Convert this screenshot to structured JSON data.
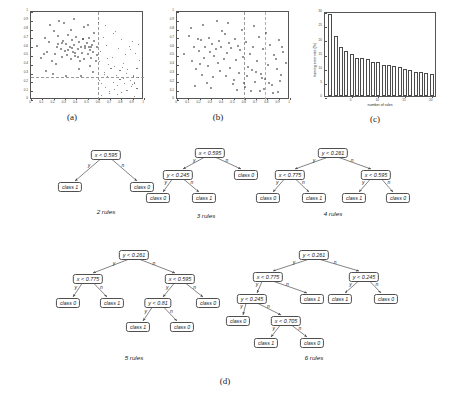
{
  "figure": {
    "subcaptions": [
      "(a)",
      "(b)",
      "(c)",
      "(d)"
    ]
  },
  "chart_data": [
    {
      "panel": "(a)",
      "type": "scatter",
      "title": "",
      "xlabel": "",
      "ylabel": "",
      "xlim": [
        0,
        1
      ],
      "ylim": [
        0,
        1
      ],
      "xticks": [
        0,
        0.1,
        0.2,
        0.3,
        0.4,
        0.5,
        0.6,
        0.7,
        0.8,
        0.9,
        1
      ],
      "yticks": [
        0,
        0.1,
        0.2,
        0.3,
        0.4,
        0.5,
        0.6,
        0.7,
        0.8,
        0.9,
        1
      ],
      "grid": false,
      "legend": "none",
      "annotations": [
        "vertical dashed split at x = 0.595",
        "horizontal dashed split at y = 0.261"
      ],
      "split_lines": {
        "vertical_x": 0.595,
        "horizontal_y": 0.261
      },
      "series": [
        {
          "name": "class 1",
          "marker": "circle",
          "x": [
            0.05,
            0.09,
            0.12,
            0.14,
            0.16,
            0.18,
            0.2,
            0.21,
            0.23,
            0.24,
            0.26,
            0.27,
            0.28,
            0.3,
            0.31,
            0.32,
            0.33,
            0.34,
            0.35,
            0.36,
            0.37,
            0.38,
            0.39,
            0.4,
            0.41,
            0.42,
            0.43,
            0.44,
            0.45,
            0.46,
            0.47,
            0.48,
            0.49,
            0.5,
            0.51,
            0.52,
            0.53,
            0.54,
            0.55,
            0.56,
            0.57,
            0.58,
            0.13,
            0.17,
            0.22,
            0.29,
            0.35,
            0.42,
            0.47,
            0.52,
            0.56,
            0.19,
            0.25,
            0.31,
            0.38,
            0.44,
            0.5,
            0.55,
            0.11,
            0.24,
            0.36,
            0.48,
            0.58,
            0.33,
            0.41,
            0.46,
            0.53,
            0.27,
            0.39,
            0.51
          ],
          "y": [
            0.62,
            0.48,
            0.71,
            0.55,
            0.66,
            0.44,
            0.79,
            0.52,
            0.61,
            0.73,
            0.58,
            0.49,
            0.67,
            0.56,
            0.64,
            0.51,
            0.74,
            0.6,
            0.47,
            0.68,
            0.55,
            0.63,
            0.5,
            0.72,
            0.58,
            0.66,
            0.45,
            0.61,
            0.54,
            0.69,
            0.47,
            0.59,
            0.65,
            0.52,
            0.71,
            0.57,
            0.48,
            0.63,
            0.55,
            0.67,
            0.44,
            0.6,
            0.33,
            0.85,
            0.41,
            0.88,
            0.8,
            0.36,
            0.83,
            0.39,
            0.76,
            0.3,
            0.9,
            0.28,
            0.92,
            0.27,
            0.86,
            0.32,
            0.53,
            0.64,
            0.59,
            0.62,
            0.51,
            0.57,
            0.49,
            0.7,
            0.61,
            0.65,
            0.54,
            0.6
          ]
        },
        {
          "name": "class 0",
          "marker": "circle",
          "x": [
            0.61,
            0.63,
            0.65,
            0.66,
            0.68,
            0.7,
            0.71,
            0.73,
            0.74,
            0.76,
            0.77,
            0.79,
            0.8,
            0.82,
            0.83,
            0.85,
            0.86,
            0.88,
            0.89,
            0.91,
            0.92,
            0.94,
            0.95,
            0.62,
            0.67,
            0.72,
            0.78,
            0.84,
            0.9,
            0.96,
            0.64,
            0.69,
            0.75,
            0.81,
            0.87,
            0.93,
            0.6,
            0.66,
            0.73,
            0.8,
            0.88,
            0.95,
            0.63,
            0.7,
            0.77,
            0.85,
            0.92,
            0.61,
            0.74,
            0.86,
            0.65,
            0.79,
            0.9,
            0.68,
            0.82,
            0.94
          ],
          "y": [
            0.22,
            0.18,
            0.31,
            0.14,
            0.26,
            0.09,
            0.35,
            0.2,
            0.12,
            0.28,
            0.16,
            0.33,
            0.08,
            0.24,
            0.18,
            0.3,
            0.11,
            0.22,
            0.15,
            0.27,
            0.19,
            0.13,
            0.25,
            0.55,
            0.62,
            0.48,
            0.58,
            0.51,
            0.66,
            0.45,
            0.71,
            0.4,
            0.78,
            0.37,
            0.6,
            0.53,
            0.88,
            0.84,
            0.75,
            0.68,
            0.57,
            0.63,
            0.05,
            0.07,
            0.06,
            0.1,
            0.04,
            0.43,
            0.38,
            0.34,
            0.29,
            0.23,
            0.17,
            0.47,
            0.41,
            0.36
          ]
        }
      ]
    },
    {
      "panel": "(b)",
      "type": "scatter",
      "title": "",
      "xlabel": "",
      "ylabel": "",
      "xlim": [
        0,
        1
      ],
      "ylim": [
        0,
        1
      ],
      "xticks": [
        0,
        0.1,
        0.2,
        0.3,
        0.4,
        0.5,
        0.6,
        0.7,
        0.8,
        0.9,
        1
      ],
      "yticks": [
        0,
        0.1,
        0.2,
        0.3,
        0.4,
        0.5,
        0.6,
        0.7,
        0.8,
        0.9,
        1
      ],
      "grid": false,
      "legend": "none",
      "annotations": [
        "vertical dashed split near x = 0.595",
        "vertical dashed split near x = 0.775"
      ],
      "split_lines": {
        "vertical_x": 0.595,
        "vertical_x2": 0.775
      },
      "series": [
        {
          "name": "points",
          "marker": "circle",
          "x": [
            0.06,
            0.1,
            0.13,
            0.15,
            0.17,
            0.19,
            0.21,
            0.22,
            0.24,
            0.25,
            0.27,
            0.28,
            0.29,
            0.31,
            0.32,
            0.33,
            0.34,
            0.36,
            0.37,
            0.38,
            0.39,
            0.41,
            0.42,
            0.43,
            0.44,
            0.46,
            0.47,
            0.48,
            0.5,
            0.51,
            0.52,
            0.54,
            0.55,
            0.56,
            0.58,
            0.59,
            0.61,
            0.62,
            0.64,
            0.66,
            0.67,
            0.69,
            0.71,
            0.72,
            0.74,
            0.76,
            0.78,
            0.8,
            0.82,
            0.84,
            0.86,
            0.88,
            0.9,
            0.92,
            0.94,
            0.96,
            0.12,
            0.23,
            0.35,
            0.45,
            0.57,
            0.68,
            0.79,
            0.91,
            0.16,
            0.3,
            0.4,
            0.53,
            0.65,
            0.77,
            0.89,
            0.2,
            0.26,
            0.49,
            0.6,
            0.73,
            0.85,
            0.18,
            0.63,
            0.7,
            0.75,
            0.81,
            0.87,
            0.93
          ],
          "y": [
            0.52,
            0.73,
            0.44,
            0.61,
            0.35,
            0.56,
            0.68,
            0.29,
            0.48,
            0.6,
            0.39,
            0.71,
            0.55,
            0.64,
            0.26,
            0.5,
            0.58,
            0.42,
            0.67,
            0.33,
            0.61,
            0.47,
            0.75,
            0.28,
            0.54,
            0.65,
            0.37,
            0.59,
            0.23,
            0.7,
            0.46,
            0.62,
            0.31,
            0.57,
            0.49,
            0.19,
            0.66,
            0.27,
            0.53,
            0.34,
            0.6,
            0.21,
            0.45,
            0.72,
            0.3,
            0.58,
            0.24,
            0.4,
            0.63,
            0.17,
            0.51,
            0.36,
            0.68,
            0.29,
            0.55,
            0.42,
            0.82,
            0.86,
            0.9,
            0.88,
            0.8,
            0.84,
            0.76,
            0.22,
            0.16,
            0.14,
            0.79,
            0.12,
            0.1,
            0.13,
            0.09,
            0.41,
            0.2,
            0.18,
            0.15,
            0.11,
            0.08,
            0.69,
            0.38,
            0.32,
            0.25,
            0.19,
            0.47,
            0.61
          ]
        }
      ]
    },
    {
      "panel": "(c)",
      "type": "bar",
      "title": "",
      "xlabel": "number of rules",
      "ylabel": "training error rate (%)",
      "xlim": [
        0,
        21
      ],
      "ylim": [
        0,
        30
      ],
      "xticks": [
        5,
        10,
        15,
        20
      ],
      "yticks": [
        0,
        5,
        10,
        15,
        20,
        25,
        30
      ],
      "grid": false,
      "legend": "none",
      "categories": [
        1,
        2,
        3,
        4,
        5,
        6,
        7,
        8,
        9,
        10,
        11,
        12,
        13,
        14,
        15,
        16,
        17,
        18,
        19,
        20
      ],
      "values": [
        28.8,
        21.2,
        17.3,
        16.0,
        15.0,
        13.4,
        13.3,
        13.2,
        12.0,
        12.0,
        11.0,
        10.8,
        10.6,
        10.4,
        9.4,
        9.2,
        8.5,
        8.5,
        8.0,
        7.8
      ]
    }
  ],
  "trees": [
    {
      "caption": "2 rules",
      "nodes": [
        {
          "id": "r",
          "label": "x < 0.595",
          "kind": "test"
        },
        {
          "id": "l1",
          "label": "class 1",
          "kind": "leaf"
        },
        {
          "id": "l2",
          "label": "class 0",
          "kind": "leaf"
        }
      ],
      "edges": [
        {
          "from": "r",
          "to": "l1",
          "label": "y"
        },
        {
          "from": "r",
          "to": "l2",
          "label": "n"
        }
      ]
    },
    {
      "caption": "3 rules",
      "nodes": [
        {
          "id": "r",
          "label": "x < 0.595",
          "kind": "test"
        },
        {
          "id": "a",
          "label": "y < 0.245",
          "kind": "test"
        },
        {
          "id": "l1",
          "label": "class 0",
          "kind": "leaf"
        },
        {
          "id": "l2",
          "label": "class 1",
          "kind": "leaf"
        },
        {
          "id": "l3",
          "label": "class 0",
          "kind": "leaf"
        }
      ],
      "edges": [
        {
          "from": "r",
          "to": "a",
          "label": "y"
        },
        {
          "from": "r",
          "to": "l3",
          "label": "n"
        },
        {
          "from": "a",
          "to": "l1",
          "label": "y"
        },
        {
          "from": "a",
          "to": "l2",
          "label": "n"
        }
      ]
    },
    {
      "caption": "4 rules",
      "nodes": [
        {
          "id": "r",
          "label": "y < 0.261",
          "kind": "test"
        },
        {
          "id": "a",
          "label": "x < 0.775",
          "kind": "test"
        },
        {
          "id": "b",
          "label": "x < 0.595",
          "kind": "test"
        },
        {
          "id": "l1",
          "label": "class 0",
          "kind": "leaf"
        },
        {
          "id": "l2",
          "label": "class 1",
          "kind": "leaf"
        },
        {
          "id": "l3",
          "label": "class 1",
          "kind": "leaf"
        },
        {
          "id": "l4",
          "label": "class 0",
          "kind": "leaf"
        }
      ],
      "edges": [
        {
          "from": "r",
          "to": "a",
          "label": "y"
        },
        {
          "from": "r",
          "to": "b",
          "label": "n"
        },
        {
          "from": "a",
          "to": "l1",
          "label": "y"
        },
        {
          "from": "a",
          "to": "l2",
          "label": "n"
        },
        {
          "from": "b",
          "to": "l3",
          "label": "y"
        },
        {
          "from": "b",
          "to": "l4",
          "label": "n"
        }
      ]
    },
    {
      "caption": "5 rules",
      "nodes": [
        {
          "id": "r",
          "label": "y < 0.261",
          "kind": "test"
        },
        {
          "id": "a",
          "label": "x < 0.775",
          "kind": "test"
        },
        {
          "id": "b",
          "label": "x < 0.595",
          "kind": "test"
        },
        {
          "id": "c",
          "label": "y < 0.81",
          "kind": "test"
        },
        {
          "id": "l1",
          "label": "class 0",
          "kind": "leaf"
        },
        {
          "id": "l2",
          "label": "class 1",
          "kind": "leaf"
        },
        {
          "id": "l3",
          "label": "class 1",
          "kind": "leaf"
        },
        {
          "id": "l4",
          "label": "class 0",
          "kind": "leaf"
        },
        {
          "id": "l5",
          "label": "class 0",
          "kind": "leaf"
        }
      ],
      "edges": [
        {
          "from": "r",
          "to": "a",
          "label": "y"
        },
        {
          "from": "r",
          "to": "b",
          "label": "n"
        },
        {
          "from": "a",
          "to": "l1",
          "label": "y"
        },
        {
          "from": "a",
          "to": "l2",
          "label": "n"
        },
        {
          "from": "b",
          "to": "c",
          "label": "y"
        },
        {
          "from": "b",
          "to": "l5",
          "label": "n"
        },
        {
          "from": "c",
          "to": "l3",
          "label": "y"
        },
        {
          "from": "c",
          "to": "l4",
          "label": "n"
        }
      ]
    },
    {
      "caption": "6 rules",
      "nodes": [
        {
          "id": "r",
          "label": "y < 0.261",
          "kind": "test"
        },
        {
          "id": "a",
          "label": "x < 0.775",
          "kind": "test"
        },
        {
          "id": "b",
          "label": "y < 0.245",
          "kind": "test"
        },
        {
          "id": "c",
          "label": "y < 0.245",
          "kind": "test"
        },
        {
          "id": "d",
          "label": "x < 0.705",
          "kind": "test"
        },
        {
          "id": "l1",
          "label": "class 0",
          "kind": "leaf"
        },
        {
          "id": "l2",
          "label": "class 1",
          "kind": "leaf"
        },
        {
          "id": "l3",
          "label": "class 0",
          "kind": "leaf"
        },
        {
          "id": "l4",
          "label": "class 1",
          "kind": "leaf"
        },
        {
          "id": "l5",
          "label": "class 1",
          "kind": "leaf"
        },
        {
          "id": "l6",
          "label": "class 0",
          "kind": "leaf"
        }
      ],
      "edges": [
        {
          "from": "r",
          "to": "a",
          "label": "y"
        },
        {
          "from": "r",
          "to": "c",
          "label": "n"
        },
        {
          "from": "a",
          "to": "b",
          "label": "y"
        },
        {
          "from": "a",
          "to": "l2",
          "label": "n"
        },
        {
          "from": "b",
          "to": "l1",
          "label": "y"
        },
        {
          "from": "b",
          "to": "d",
          "label": "n"
        },
        {
          "from": "d",
          "to": "l4",
          "label": "y"
        },
        {
          "from": "d",
          "to": "l3",
          "label": "n"
        },
        {
          "from": "c",
          "to": "l5",
          "label": "y"
        },
        {
          "from": "c",
          "to": "l6",
          "label": "n"
        }
      ]
    }
  ]
}
